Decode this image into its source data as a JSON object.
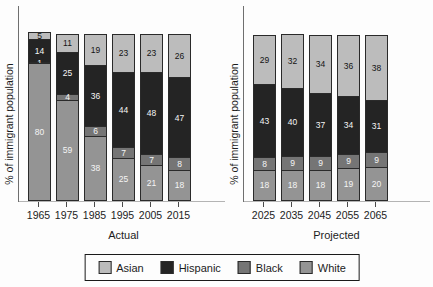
{
  "chart_data": {
    "type": "bar",
    "stacked": true,
    "ylabel": "% of immigrant population",
    "ylim": [
      0,
      100
    ],
    "grid": false,
    "legend_position": "bottom",
    "legend": [
      {
        "label": "Asian",
        "color": "#bcbcbc",
        "text_color": "#141414"
      },
      {
        "label": "Hispanic",
        "color": "#242424",
        "text_color": "#f5f5f5"
      },
      {
        "label": "Black",
        "color": "#757575",
        "text_color": "#f5f5f5"
      },
      {
        "label": "White",
        "color": "#949494",
        "text_color": "#f5f5f5"
      }
    ],
    "panels": [
      {
        "caption": "Actual",
        "categories": [
          "1965",
          "1975",
          "1985",
          "1995",
          "2005",
          "2015"
        ],
        "series": [
          {
            "name": "Asian",
            "values": [
              5,
              11,
              19,
              23,
              23,
              26
            ]
          },
          {
            "name": "Hispanic",
            "values": [
              14,
              25,
              36,
              44,
              48,
              47
            ]
          },
          {
            "name": "Black",
            "values": [
              1,
              4,
              6,
              7,
              7,
              8
            ]
          },
          {
            "name": "White",
            "values": [
              80,
              59,
              38,
              25,
              21,
              18
            ]
          }
        ]
      },
      {
        "caption": "Projected",
        "categories": [
          "2025",
          "2035",
          "2045",
          "2055",
          "2065"
        ],
        "series": [
          {
            "name": "Asian",
            "values": [
              29,
              32,
              34,
              36,
              38
            ]
          },
          {
            "name": "Hispanic",
            "values": [
              43,
              40,
              37,
              34,
              31
            ]
          },
          {
            "name": "Black",
            "values": [
              8,
              9,
              9,
              9,
              9
            ]
          },
          {
            "name": "White",
            "values": [
              18,
              18,
              18,
              19,
              20
            ]
          }
        ]
      }
    ]
  }
}
